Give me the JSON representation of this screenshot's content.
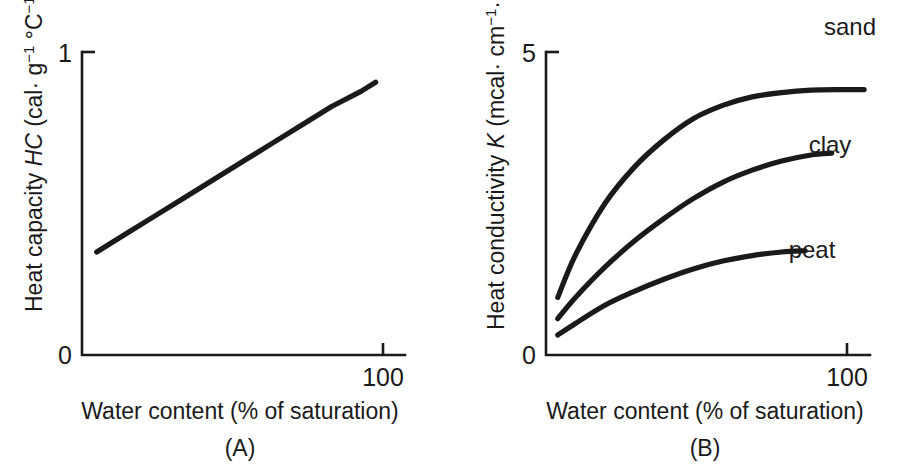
{
  "figure": {
    "background_color": "#ffffff",
    "ink_color": "#1a1a1a",
    "panels": [
      {
        "caption": "(A)",
        "xlabel": "Water content (% of saturation)",
        "ylabel_prefix": "Heat capacity ",
        "ylabel_symbol": "HC",
        "ylabel_units_open": " (cal· g",
        "ylabel_units_exp1": "−1",
        "ylabel_units_mid": " °C",
        "ylabel_units_exp2": "−1",
        "ylabel_units_close": ")",
        "ytick_top": "1",
        "ytick_bottom": "0",
        "xtick": "100"
      },
      {
        "caption": "(B)",
        "xlabel": "Water content (% of saturation)",
        "ylabel_prefix": "Heat conductivity ",
        "ylabel_symbol": "K",
        "ylabel_units_open": " (mcal· cm",
        "ylabel_units_exp1": "−1",
        "ylabel_units_mid": "· °C",
        "ylabel_units_exp2": "−1",
        "ylabel_units_close": ")",
        "ytick_top": "5",
        "ytick_bottom": "0",
        "xtick": "100",
        "curve_labels": [
          "sand",
          "clay",
          "peat"
        ]
      }
    ]
  },
  "chart_data": [
    {
      "type": "line",
      "panel": "A",
      "title": "",
      "xlabel": "Water content (% of saturation)",
      "ylabel": "Heat capacity HC (cal· g−1 °C−1)",
      "xlim": [
        0,
        110
      ],
      "ylim": [
        0,
        1
      ],
      "xticks": [
        100
      ],
      "xticklabels": [
        "100"
      ],
      "yticks": [
        0,
        1
      ],
      "yticklabels": [
        "0",
        "1"
      ],
      "grid": false,
      "legend": "none",
      "series": [
        {
          "name": "heat capacity",
          "x": [
            5,
            15,
            25,
            35,
            45,
            55,
            65,
            75,
            85,
            95,
            100
          ],
          "y": [
            0.34,
            0.4,
            0.46,
            0.52,
            0.58,
            0.64,
            0.7,
            0.76,
            0.82,
            0.87,
            0.9
          ]
        }
      ]
    },
    {
      "type": "line",
      "panel": "B",
      "title": "",
      "xlabel": "Water content (% of saturation)",
      "ylabel": "Heat conductivity K (mcal· cm−1· °C−1)",
      "xlim": [
        0,
        110
      ],
      "ylim": [
        0,
        5
      ],
      "xticks": [
        100
      ],
      "xticklabels": [
        "100"
      ],
      "yticks": [
        0,
        5
      ],
      "yticklabels": [
        "0",
        "5"
      ],
      "grid": false,
      "legend": "inline-labels-right",
      "series": [
        {
          "name": "sand",
          "x": [
            4,
            10,
            20,
            30,
            40,
            50,
            60,
            70,
            80,
            90,
            100,
            108
          ],
          "y": [
            0.95,
            1.65,
            2.5,
            3.1,
            3.55,
            3.9,
            4.12,
            4.26,
            4.33,
            4.37,
            4.38,
            4.38
          ]
        },
        {
          "name": "clay",
          "x": [
            4,
            10,
            20,
            30,
            40,
            50,
            60,
            70,
            80,
            90,
            97
          ],
          "y": [
            0.6,
            0.95,
            1.45,
            1.88,
            2.25,
            2.58,
            2.85,
            3.05,
            3.2,
            3.3,
            3.33
          ]
        },
        {
          "name": "peat",
          "x": [
            4,
            10,
            20,
            30,
            40,
            50,
            60,
            70,
            80,
            88
          ],
          "y": [
            0.33,
            0.52,
            0.82,
            1.05,
            1.25,
            1.42,
            1.55,
            1.64,
            1.7,
            1.72
          ]
        }
      ]
    }
  ]
}
